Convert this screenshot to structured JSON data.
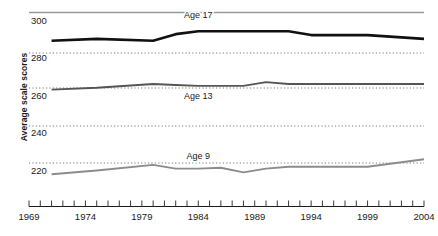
{
  "chart_data": {
    "type": "line",
    "title": "",
    "xlabel": "",
    "ylabel": "Average scale scores",
    "xlim": [
      1969,
      2004
    ],
    "ylim": [
      210,
      302
    ],
    "grid": true,
    "gridlines_y": [
      300,
      280,
      260,
      240,
      220
    ],
    "ytick_labels": [
      "300",
      "280",
      "260",
      "240",
      "220"
    ],
    "xtick_labels": [
      "1969",
      "1974",
      "1979",
      "1984",
      "1989",
      "1994",
      "1999",
      "2004"
    ],
    "xtick_values": [
      1969,
      1974,
      1979,
      1984,
      1989,
      1994,
      1999,
      2004
    ],
    "xminor_step": 1,
    "legend": "inline-labels",
    "series": [
      {
        "name": "Age 17",
        "label": "Age 17",
        "color": "#111111",
        "width": 2.6,
        "label_x": 1984,
        "label_y": 297,
        "x": [
          1971,
          1975,
          1980,
          1982,
          1984,
          1986,
          1988,
          1990,
          1992,
          1994,
          1996,
          1999,
          2004
        ],
        "values": [
          285,
          286,
          285,
          288.5,
          290,
          290,
          290,
          290,
          290,
          288,
          288,
          288,
          286
        ]
      },
      {
        "name": "Age 13",
        "label": "Age 13",
        "color": "#555555",
        "width": 1.9,
        "label_x": 1984,
        "label_y": 254,
        "x": [
          1971,
          1975,
          1980,
          1982,
          1984,
          1986,
          1988,
          1990,
          1992,
          1994,
          1996,
          1999,
          2004
        ],
        "values": [
          259,
          260,
          262,
          261.5,
          261,
          261,
          261,
          263,
          262,
          262,
          262,
          262,
          262
        ]
      },
      {
        "name": "Age 9",
        "label": "Age 9",
        "color": "#8c8c8c",
        "width": 1.9,
        "label_x": 1984,
        "label_y": 222,
        "x": [
          1971,
          1975,
          1980,
          1982,
          1984,
          1986,
          1988,
          1990,
          1992,
          1994,
          1996,
          1999,
          2004
        ],
        "values": [
          214,
          216,
          219,
          217,
          217,
          217.5,
          215,
          217,
          218,
          218,
          218,
          218,
          222
        ]
      }
    ]
  },
  "axis": {
    "y_axis_title": "Average scale scores",
    "y_labels": [
      "300",
      "280",
      "260",
      "240",
      "220"
    ],
    "x_labels": [
      "1969",
      "1974",
      "1979",
      "1984",
      "1989",
      "1994",
      "1999",
      "2004"
    ]
  },
  "series_labels": {
    "age17": "Age 17",
    "age13": "Age 13",
    "age9": "Age 9"
  }
}
